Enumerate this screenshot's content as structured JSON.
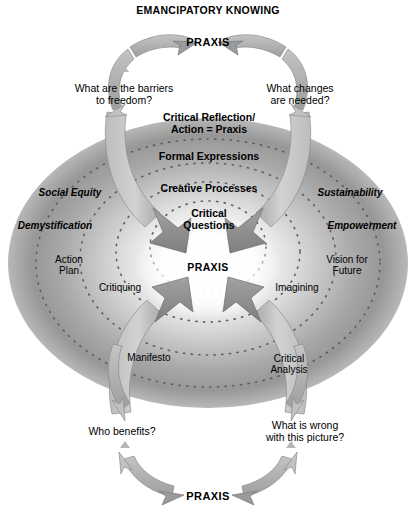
{
  "title": "EMANCIPATORY KNOWING",
  "colors": {
    "text": "#000000",
    "oval_edge": "#8e8e8e",
    "oval_center": "#ffffff",
    "arrow_light": "#c9c9c9",
    "arrow_mid": "#9a9a9a",
    "arrow_dark": "#7d7d7d",
    "dotted_ring": "#6f6f6f",
    "background": "#ffffff"
  },
  "praxis_nodes": {
    "top": "PRAXIS",
    "center": "PRAXIS",
    "bottom": "PRAXIS"
  },
  "questions": [
    {
      "id": "barriers",
      "text": "What are the barriers\nto freedom?"
    },
    {
      "id": "changes",
      "text": "What changes\nare needed?"
    },
    {
      "id": "benefits",
      "text": "Who benefits?"
    },
    {
      "id": "wrong",
      "text": "What is wrong\nwith this picture?"
    }
  ],
  "core_rings": [
    {
      "id": "critical-reflection",
      "text": "Critical Reflection/\nAction = Praxis"
    },
    {
      "id": "formal-expressions",
      "text": "Formal Expressions"
    },
    {
      "id": "creative-processes",
      "text": "Creative Processes"
    },
    {
      "id": "critical-questions",
      "text": "Critical\nQuestions"
    }
  ],
  "side_labels": [
    {
      "id": "social-equity",
      "text": "Social Equity",
      "style": "bold-italic",
      "side": "left"
    },
    {
      "id": "demystification",
      "text": "Demystification",
      "style": "bold-italic",
      "side": "left"
    },
    {
      "id": "sustainability",
      "text": "Sustainability",
      "style": "bold-italic",
      "side": "right"
    },
    {
      "id": "empowerment",
      "text": "Empowerment",
      "style": "bold-italic",
      "side": "right"
    }
  ],
  "process_labels": [
    {
      "id": "action-plan",
      "text": "Action\nPlan"
    },
    {
      "id": "critiquing",
      "text": "Critiquing"
    },
    {
      "id": "vision-for-future",
      "text": "Vision for\nFuture"
    },
    {
      "id": "imagining",
      "text": "Imagining"
    },
    {
      "id": "manifesto",
      "text": "Manifesto"
    },
    {
      "id": "critical-analysis",
      "text": "Critical\nAnalysis"
    }
  ]
}
